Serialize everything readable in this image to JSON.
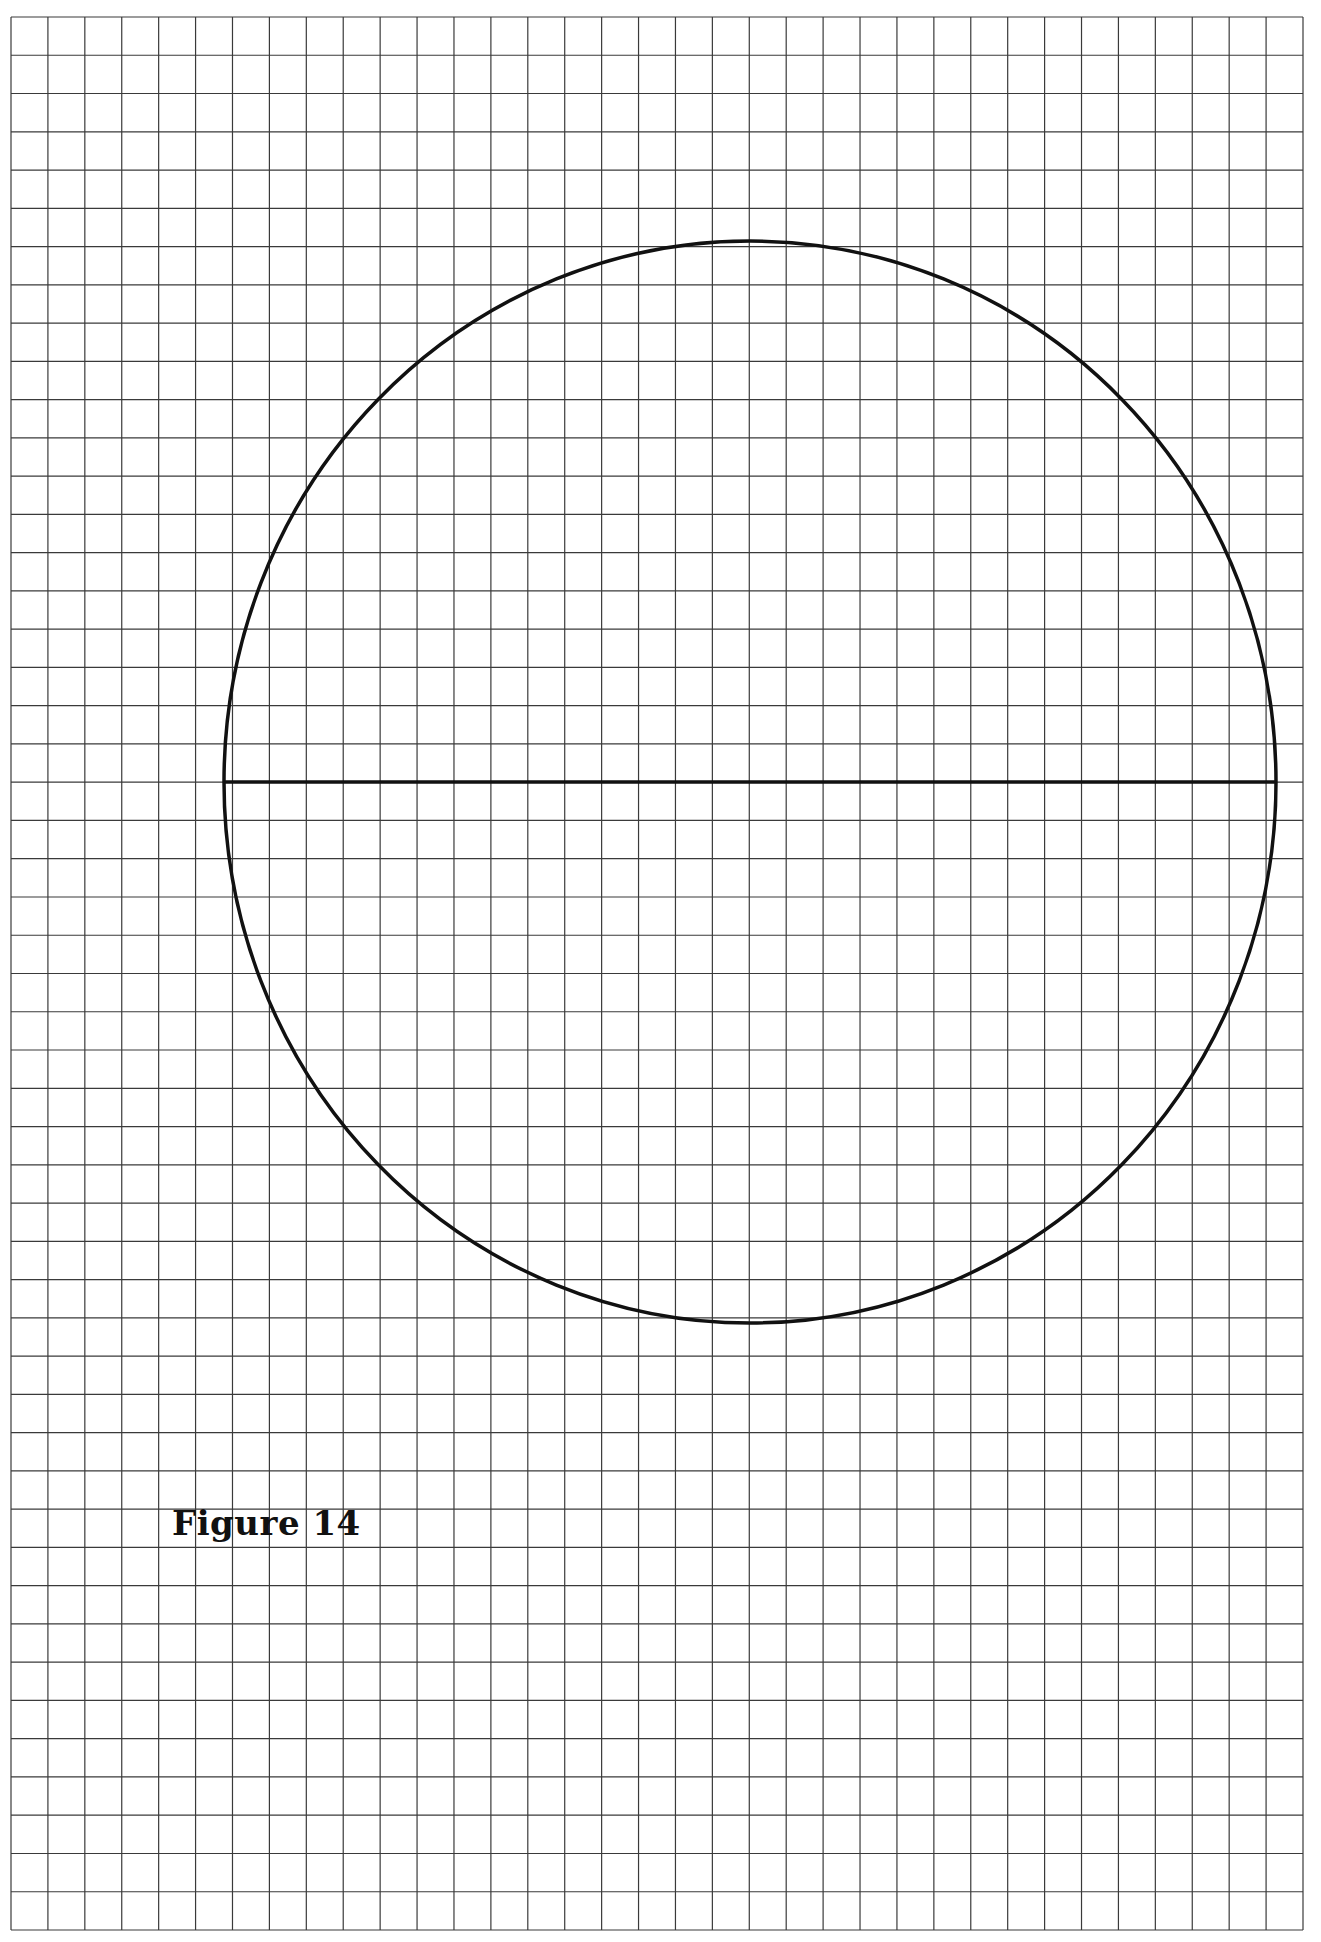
{
  "figure": {
    "label": "Figure 14",
    "caption_position": {
      "x": 172,
      "y": 1503
    }
  },
  "grid": {
    "left": 11,
    "top": 17,
    "right": 1303,
    "bottom": 1930,
    "columns": 35,
    "rows": 50,
    "line_color": "#3a3a3a",
    "line_width": 1.2
  },
  "circle": {
    "center_col": 20,
    "center_row": 20,
    "cx": 750,
    "cy": 782,
    "rx": 526,
    "ry": 541,
    "stroke_color": "#111111",
    "stroke_width": 3.5
  },
  "diameter": {
    "x1": 224,
    "x2": 1276,
    "y": 782,
    "stroke_color": "#111111",
    "stroke_width": 3.5
  },
  "colors": {
    "background": "#ffffff",
    "ink": "#111111",
    "grid": "#3a3a3a"
  }
}
